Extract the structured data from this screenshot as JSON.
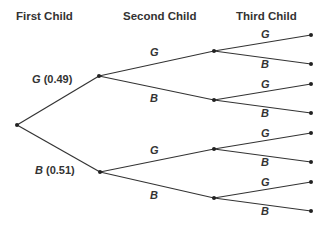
{
  "headers": {
    "first": "First Child",
    "second": "Second Child",
    "third": "Third Child"
  },
  "first_level": {
    "g": {
      "letter": "G",
      "prob": "(0.49)"
    },
    "b": {
      "letter": "B",
      "prob": "(0.51)"
    }
  },
  "second_level": {
    "g_branch": {
      "top": "G",
      "bottom": "B"
    },
    "b_branch": {
      "top": "G",
      "bottom": "B"
    }
  },
  "third_level": {
    "gg": {
      "top": "G",
      "bottom": "B"
    },
    "gb": {
      "top": "G",
      "bottom": "B"
    },
    "bg": {
      "top": "G",
      "bottom": "B"
    },
    "bb": {
      "top": "G",
      "bottom": "B"
    }
  },
  "colors": {
    "line": "#333333",
    "node": "#222222"
  }
}
